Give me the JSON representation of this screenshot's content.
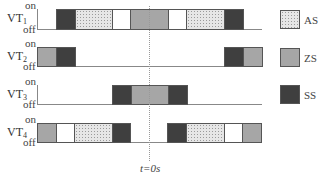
{
  "diagram": {
    "type": "timing-diagram",
    "state_labels": {
      "on": "on",
      "off": "off"
    },
    "time_marker": {
      "label": "t=0s",
      "x": 149
    },
    "rows": [
      {
        "name": "VT",
        "sub": "1",
        "top": 9,
        "bottom": 29,
        "line_end": 262,
        "segments": [
          {
            "state": "SS",
            "x0": 56,
            "x1": 75
          },
          {
            "state": "AS",
            "x0": 75,
            "x1": 112
          },
          {
            "state": "W",
            "x0": 112,
            "x1": 130
          },
          {
            "state": "ZS",
            "x0": 130,
            "x1": 168
          },
          {
            "state": "W",
            "x0": 168,
            "x1": 186
          },
          {
            "state": "AS",
            "x0": 186,
            "x1": 224
          },
          {
            "state": "SS",
            "x0": 224,
            "x1": 243
          }
        ]
      },
      {
        "name": "VT",
        "sub": "2",
        "top": 47,
        "bottom": 66,
        "line_end": 262,
        "segments": [
          {
            "state": "ZS",
            "x0": 37,
            "x1": 56
          },
          {
            "state": "SS",
            "x0": 56,
            "x1": 75
          },
          {
            "state": "SS",
            "x0": 224,
            "x1": 243
          },
          {
            "state": "ZS",
            "x0": 243,
            "x1": 262
          }
        ]
      },
      {
        "name": "VT",
        "sub": "3",
        "top": 85,
        "bottom": 104,
        "line_end": 262,
        "segments": [
          {
            "state": "SS",
            "x0": 112,
            "x1": 131
          },
          {
            "state": "ZS",
            "x0": 131,
            "x1": 168
          },
          {
            "state": "SS",
            "x0": 168,
            "x1": 187
          }
        ]
      },
      {
        "name": "VT",
        "sub": "4",
        "top": 123,
        "bottom": 142,
        "line_end": 262,
        "segments": [
          {
            "state": "ZS",
            "x0": 37,
            "x1": 56
          },
          {
            "state": "W",
            "x0": 56,
            "x1": 74
          },
          {
            "state": "AS",
            "x0": 74,
            "x1": 112
          },
          {
            "state": "SS",
            "x0": 112,
            "x1": 130
          },
          {
            "state": "SS",
            "x0": 167,
            "x1": 186
          },
          {
            "state": "AS",
            "x0": 186,
            "x1": 224
          },
          {
            "state": "W",
            "x0": 224,
            "x1": 242
          },
          {
            "state": "ZS",
            "x0": 242,
            "x1": 261
          }
        ]
      }
    ],
    "legend": [
      {
        "key": "AS",
        "label": "AS",
        "y": 10
      },
      {
        "key": "ZS",
        "label": "ZS",
        "y": 48
      },
      {
        "key": "SS",
        "label": "SS",
        "y": 85
      }
    ]
  }
}
